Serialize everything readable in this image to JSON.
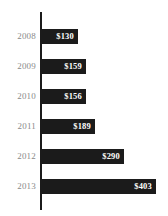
{
  "chart_data": {
    "type": "bar",
    "orientation": "horizontal",
    "title": "",
    "xlabel": "",
    "ylabel": "",
    "categories": [
      "2008",
      "2009",
      "2010",
      "2011",
      "2012",
      "2013"
    ],
    "values": [
      130,
      159,
      156,
      189,
      290,
      403
    ],
    "value_labels": [
      "$130",
      "$159",
      "$156",
      "$189",
      "$290",
      "$403"
    ],
    "xlim": [
      0,
      403
    ],
    "grid": false,
    "legend": false,
    "bar_color": "#1b1b1b",
    "value_label_color": "#ffffff",
    "category_label_color": "#8a8a8a",
    "background_color": "#ffffff",
    "axis_color": "#1b1b1b",
    "series": [
      {
        "name": "",
        "values": [
          130,
          159,
          156,
          189,
          290,
          403
        ]
      }
    ],
    "points": [
      {
        "category": "2008",
        "value": 130,
        "label": "$130"
      },
      {
        "category": "2009",
        "value": 159,
        "label": "$159"
      },
      {
        "category": "2010",
        "value": 156,
        "label": "$156"
      },
      {
        "category": "2011",
        "value": 189,
        "label": "$189"
      },
      {
        "category": "2012",
        "value": 290,
        "label": "$290"
      },
      {
        "category": "2013",
        "value": 403,
        "label": "$403"
      }
    ]
  },
  "rows": [
    {
      "category": "2008",
      "label": "$130",
      "value": 130,
      "top": 29
    },
    {
      "category": "2009",
      "label": "$159",
      "value": 159,
      "top": 59
    },
    {
      "category": "2010",
      "label": "$156",
      "value": 156,
      "top": 89
    },
    {
      "category": "2011",
      "label": "$189",
      "value": 189,
      "top": 119
    },
    {
      "category": "2012",
      "label": "$290",
      "value": 290,
      "top": 149
    },
    {
      "category": "2013",
      "label": "$403",
      "value": 403,
      "top": 179
    }
  ],
  "layout": {
    "axis_x": 41,
    "bar_start_x": 41,
    "bar_max_x": 156,
    "bar_height": 15,
    "max_value": 403
  }
}
